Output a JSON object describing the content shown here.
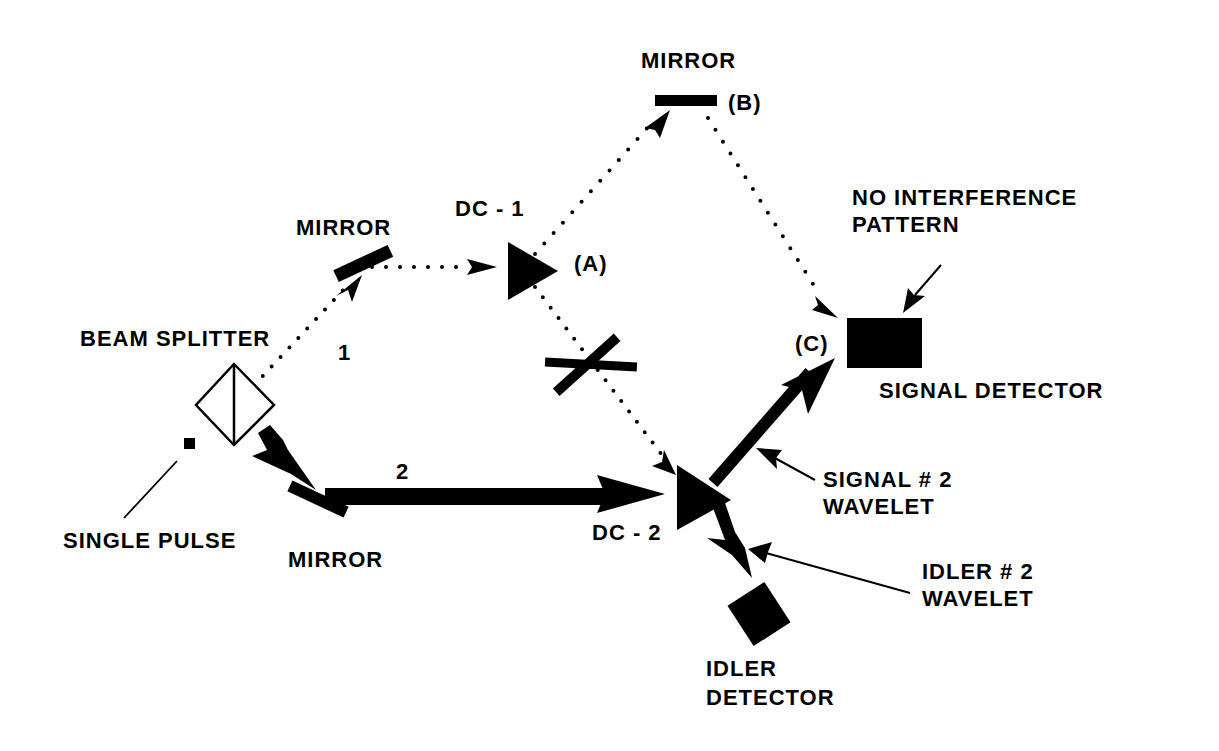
{
  "diagram": {
    "type": "delayed-choice quantum eraser / induced coherence optical setup",
    "labels": {
      "mirror_top": "MIRROR",
      "mirror_top_marker": "(B)",
      "dc1": "DC - 1",
      "dc1_marker": "(A)",
      "mirror_left": "MIRROR",
      "beam_splitter": "BEAM SPLITTER",
      "path1": "1",
      "path2": "2",
      "single_pulse": "SINGLE PULSE",
      "mirror_bottom": "MIRROR",
      "dc2": "DC - 2",
      "no_interference_line1": "NO INTERFERENCE",
      "no_interference_line2": "PATTERN",
      "signal_detector_marker": "(C)",
      "signal_detector": "SIGNAL DETECTOR",
      "signal_wavelet_line1": "SIGNAL # 2",
      "signal_wavelet_line2": "WAVELET",
      "idler_wavelet_line1": "IDLER # 2",
      "idler_wavelet_line2": "WAVELET",
      "idler_detector_line1": "IDLER",
      "idler_detector_line2": "DETECTOR"
    },
    "components": [
      {
        "name": "single-pulse-source",
        "shape": "small square"
      },
      {
        "name": "beam-splitter",
        "shape": "diamond with vertical line"
      },
      {
        "name": "mirror-left",
        "shape": "tilted bar"
      },
      {
        "name": "mirror-top-b",
        "shape": "horizontal bar"
      },
      {
        "name": "mirror-bottom",
        "shape": "tilted bar"
      },
      {
        "name": "dc-1",
        "shape": "triangle"
      },
      {
        "name": "dc-2",
        "shape": "triangle"
      },
      {
        "name": "blocker",
        "shape": "crossed bars on idler path"
      },
      {
        "name": "signal-detector",
        "shape": "filled rectangle"
      },
      {
        "name": "idler-detector",
        "shape": "filled rotated square"
      }
    ],
    "colors": {
      "ink": "#000000",
      "background": "#ffffff"
    }
  }
}
